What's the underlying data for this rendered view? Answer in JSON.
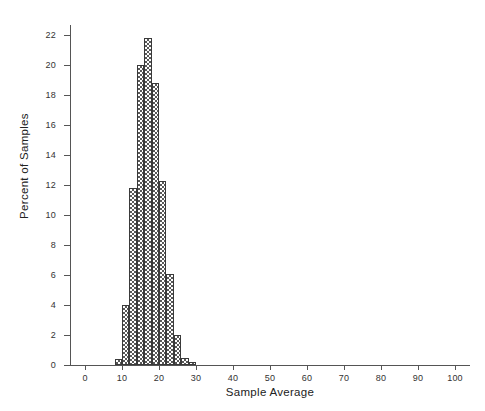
{
  "chart_data": {
    "type": "bar",
    "title": "",
    "xlabel": "Sample Average",
    "ylabel": "Percent of Samples",
    "xlim": [
      0,
      100
    ],
    "ylim": [
      0,
      22
    ],
    "grid": false,
    "legend": null,
    "bin_width": 2,
    "x_ticks": [
      0,
      10,
      20,
      30,
      40,
      50,
      60,
      70,
      80,
      90,
      100
    ],
    "x_tick_labels": [
      "0",
      "10",
      "20",
      "30",
      "40",
      "50",
      "60",
      "70",
      "80",
      "90",
      "100"
    ],
    "y_ticks": [
      0,
      2,
      4,
      6,
      8,
      10,
      12,
      14,
      16,
      18,
      20,
      22
    ],
    "y_tick_labels": [
      "0",
      "2",
      "4",
      "6",
      "8",
      "10",
      "12",
      "14",
      "16",
      "18",
      "20",
      "22"
    ],
    "bin_edges": [
      8,
      10,
      12,
      14,
      16,
      18,
      20,
      22,
      24,
      26,
      28,
      30
    ],
    "categories": [
      "8-10",
      "10-12",
      "12-14",
      "14-16",
      "16-18",
      "18-20",
      "20-22",
      "22-24",
      "24-26",
      "26-28",
      "28-30"
    ],
    "values": [
      0.4,
      4.0,
      11.8,
      20.0,
      21.8,
      18.8,
      12.3,
      6.1,
      2.0,
      0.5,
      0.2
    ],
    "bar_fill_pattern": "checkerboard",
    "bar_edge_color": "#3a3a3a",
    "bar_pattern_color": "#595959",
    "axis_color": "#555555",
    "background_color": "#ffffff"
  }
}
